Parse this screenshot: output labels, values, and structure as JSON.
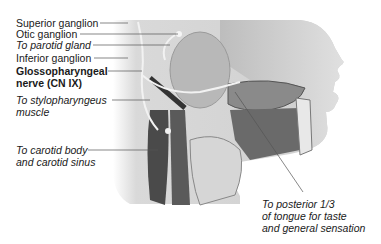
{
  "figure": {
    "labels": [
      {
        "id": "superior_ganglion",
        "text": "Superior ganglion",
        "style": "regular"
      },
      {
        "id": "otic_ganglion",
        "text": "Otic ganglion",
        "style": "regular"
      },
      {
        "id": "to_parotid_gland",
        "text": "To parotid gland",
        "style": "italic"
      },
      {
        "id": "inferior_ganglion",
        "text": "Inferior ganglion",
        "style": "regular"
      },
      {
        "id": "glossopharyngeal_line1",
        "text": "Glossopharyngeal",
        "style": "bold"
      },
      {
        "id": "glossopharyngeal_line2",
        "text": "nerve (CN IX)",
        "style": "bold"
      },
      {
        "id": "stylopharyngeus_line1",
        "text": "To stylopharyngeus",
        "style": "italic"
      },
      {
        "id": "stylopharyngeus_line2",
        "text": "muscle",
        "style": "italic"
      },
      {
        "id": "carotid_line1",
        "text": "To carotid body",
        "style": "italic"
      },
      {
        "id": "carotid_line2",
        "text": "and carotid sinus",
        "style": "italic"
      },
      {
        "id": "tongue_line1",
        "text": "To posterior 1/3",
        "style": "italic"
      },
      {
        "id": "tongue_line2",
        "text": "of tongue for taste",
        "style": "italic"
      },
      {
        "id": "tongue_line3",
        "text": "and general sensation",
        "style": "italic"
      }
    ]
  }
}
